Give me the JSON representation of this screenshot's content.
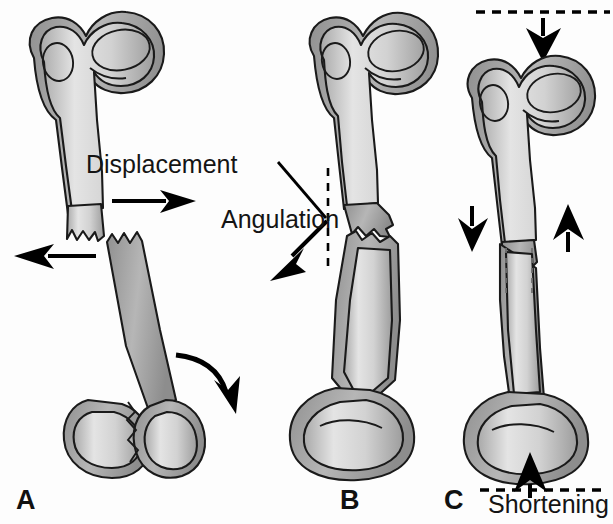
{
  "figure": {
    "background_color": "#fdfdfd",
    "line_color": "#1a1a1a",
    "bone_light": "#dedede",
    "bone_mid": "#b9b9b9",
    "bone_dark": "#9a9a9a",
    "arrow_color": "#000000"
  },
  "panels": [
    {
      "id": "A",
      "label": "A",
      "caption": "Displacement",
      "description": "Transverse femoral shaft fracture with the distal fragment displaced laterally and rotated",
      "annotations": [
        {
          "name": "displacement-arrow-right",
          "type": "straight-arrow",
          "direction": "right"
        },
        {
          "name": "displacement-arrow-left",
          "type": "straight-arrow",
          "direction": "left"
        },
        {
          "name": "rotation-arrow",
          "type": "curved-arrow",
          "direction": "clockwise"
        }
      ]
    },
    {
      "id": "B",
      "label": "B",
      "caption": "Angulation",
      "description": "Femoral shaft fracture with angular deformity measured against a vertical reference axis",
      "annotations": [
        {
          "name": "angulation-arrow",
          "type": "straight-arrow",
          "direction": "down-left"
        },
        {
          "name": "angle-reference-line",
          "type": "dashed-vertical-line"
        },
        {
          "name": "angle-limb-line",
          "type": "solid-line"
        }
      ]
    },
    {
      "id": "C",
      "label": "C",
      "caption": "Shortening",
      "description": "Femoral shaft fracture with overriding fragments producing limb length loss",
      "annotations": [
        {
          "name": "shortening-arrow-down-top",
          "type": "straight-arrow",
          "direction": "down"
        },
        {
          "name": "shortening-reference-line-top",
          "type": "dashed-horizontal-line"
        },
        {
          "name": "override-arrow-down",
          "type": "straight-arrow",
          "direction": "down"
        },
        {
          "name": "override-arrow-up",
          "type": "straight-arrow",
          "direction": "up"
        },
        {
          "name": "shortening-arrow-up-bottom",
          "type": "straight-arrow",
          "direction": "up"
        },
        {
          "name": "shortening-reference-line-bottom",
          "type": "dashed-horizontal-line"
        }
      ]
    }
  ]
}
